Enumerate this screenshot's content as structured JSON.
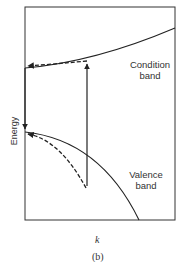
{
  "figure": {
    "caption": "(b)",
    "y_axis_label": "Energy",
    "x_axis_label": "k",
    "bands": {
      "upper_label_line1": "Condition",
      "upper_label_line2": "band",
      "lower_label_line1": "Valence",
      "lower_label_line2": "band"
    },
    "colors": {
      "line": "#222222",
      "text": "#333333",
      "background": "#ffffff"
    }
  }
}
